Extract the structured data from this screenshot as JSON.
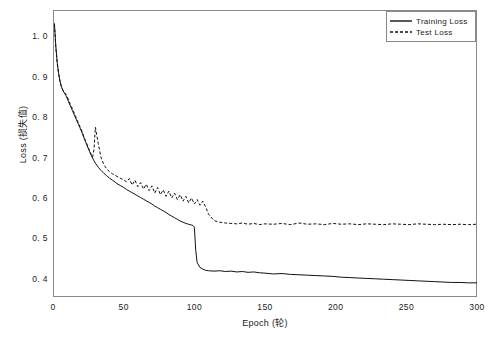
{
  "chart_data": {
    "type": "line",
    "title": "",
    "xlabel": "Epoch (轮)",
    "ylabel": "Loss (损失值)",
    "xlim": [
      0,
      300
    ],
    "ylim": [
      0.355,
      1.065
    ],
    "xticks": [
      0,
      50,
      100,
      150,
      200,
      250,
      300
    ],
    "xtick_labels": [
      "0",
      "50",
      "100",
      "150",
      "200",
      "250",
      "300"
    ],
    "yticks": [
      0.4,
      0.5,
      0.6,
      0.7,
      0.8,
      0.9,
      1.0
    ],
    "ytick_labels": [
      "0. 4",
      "0. 5",
      "0. 6",
      "0. 7",
      "0. 8",
      "0. 9",
      "1. 0"
    ],
    "grid": false,
    "legend_position": "top-right",
    "line_color": "#111111",
    "frame_color": "#8a8a8a",
    "background_color": "#ffffff",
    "series": [
      {
        "name": "Training Loss",
        "style": "solid",
        "x": [
          1,
          2,
          3,
          4,
          5,
          6,
          7,
          8,
          9,
          10,
          11,
          12,
          13,
          14,
          15,
          16,
          17,
          18,
          19,
          20,
          21,
          22,
          23,
          24,
          25,
          26,
          27,
          28,
          29,
          30,
          32,
          34,
          36,
          38,
          40,
          42,
          44,
          46,
          48,
          50,
          52,
          54,
          56,
          58,
          60,
          62,
          64,
          66,
          68,
          70,
          72,
          74,
          76,
          78,
          80,
          82,
          84,
          86,
          88,
          90,
          92,
          94,
          96,
          98,
          99,
          100,
          101,
          102,
          104,
          106,
          108,
          110,
          114,
          118,
          122,
          126,
          130,
          134,
          138,
          142,
          146,
          150,
          156,
          162,
          168,
          174,
          180,
          186,
          192,
          198,
          204,
          210,
          216,
          222,
          228,
          234,
          240,
          246,
          252,
          258,
          264,
          270,
          276,
          282,
          288,
          294,
          300
        ],
        "y": [
          1.032,
          0.975,
          0.935,
          0.908,
          0.888,
          0.875,
          0.866,
          0.86,
          0.854,
          0.847,
          0.838,
          0.83,
          0.822,
          0.814,
          0.806,
          0.798,
          0.79,
          0.782,
          0.774,
          0.766,
          0.757,
          0.748,
          0.739,
          0.731,
          0.722,
          0.714,
          0.706,
          0.699,
          0.692,
          0.686,
          0.676,
          0.668,
          0.661,
          0.655,
          0.649,
          0.644,
          0.639,
          0.634,
          0.63,
          0.626,
          0.621,
          0.617,
          0.613,
          0.609,
          0.605,
          0.601,
          0.597,
          0.593,
          0.589,
          0.585,
          0.58,
          0.576,
          0.572,
          0.568,
          0.564,
          0.559,
          0.555,
          0.551,
          0.547,
          0.543,
          0.54,
          0.537,
          0.535,
          0.533,
          0.532,
          0.528,
          0.47,
          0.44,
          0.428,
          0.424,
          0.421,
          0.42,
          0.419,
          0.42,
          0.418,
          0.419,
          0.417,
          0.418,
          0.416,
          0.417,
          0.415,
          0.414,
          0.412,
          0.413,
          0.411,
          0.41,
          0.409,
          0.408,
          0.407,
          0.406,
          0.404,
          0.403,
          0.402,
          0.401,
          0.4,
          0.399,
          0.398,
          0.397,
          0.396,
          0.395,
          0.394,
          0.393,
          0.392,
          0.391,
          0.391,
          0.39,
          0.39
        ]
      },
      {
        "name": "Test Loss",
        "style": "dashed",
        "x": [
          1,
          2,
          3,
          4,
          5,
          6,
          7,
          8,
          9,
          10,
          11,
          12,
          13,
          14,
          15,
          16,
          17,
          18,
          19,
          20,
          21,
          22,
          23,
          24,
          25,
          26,
          27,
          28,
          29,
          30,
          32,
          34,
          36,
          38,
          40,
          42,
          44,
          46,
          48,
          50,
          52,
          54,
          56,
          58,
          60,
          62,
          64,
          66,
          68,
          70,
          72,
          74,
          76,
          78,
          80,
          82,
          84,
          86,
          88,
          90,
          92,
          94,
          96,
          98,
          100,
          102,
          104,
          106,
          108,
          110,
          114,
          118,
          122,
          126,
          130,
          134,
          138,
          142,
          146,
          150,
          156,
          162,
          168,
          174,
          180,
          186,
          192,
          198,
          204,
          210,
          216,
          222,
          228,
          234,
          240,
          246,
          252,
          258,
          264,
          270,
          276,
          282,
          288,
          294,
          300
        ],
        "y": [
          1.03,
          0.972,
          0.932,
          0.906,
          0.887,
          0.874,
          0.867,
          0.862,
          0.857,
          0.851,
          0.843,
          0.834,
          0.826,
          0.818,
          0.81,
          0.802,
          0.793,
          0.785,
          0.777,
          0.77,
          0.76,
          0.75,
          0.742,
          0.733,
          0.724,
          0.716,
          0.708,
          0.701,
          0.72,
          0.775,
          0.735,
          0.7,
          0.682,
          0.672,
          0.665,
          0.66,
          0.656,
          0.652,
          0.648,
          0.645,
          0.64,
          0.648,
          0.632,
          0.644,
          0.628,
          0.638,
          0.622,
          0.634,
          0.618,
          0.63,
          0.612,
          0.626,
          0.608,
          0.62,
          0.604,
          0.617,
          0.6,
          0.612,
          0.596,
          0.608,
          0.592,
          0.604,
          0.588,
          0.6,
          0.585,
          0.596,
          0.582,
          0.592,
          0.578,
          0.56,
          0.544,
          0.54,
          0.538,
          0.537,
          0.536,
          0.538,
          0.535,
          0.537,
          0.534,
          0.536,
          0.535,
          0.537,
          0.534,
          0.538,
          0.535,
          0.536,
          0.534,
          0.537,
          0.535,
          0.536,
          0.534,
          0.536,
          0.535,
          0.534,
          0.536,
          0.535,
          0.534,
          0.536,
          0.535,
          0.534,
          0.535,
          0.534,
          0.535,
          0.534,
          0.535
        ]
      }
    ]
  },
  "legend": {
    "items": [
      {
        "label": "Training Loss",
        "style": "solid"
      },
      {
        "label": "Test Loss",
        "style": "dashed"
      }
    ]
  }
}
